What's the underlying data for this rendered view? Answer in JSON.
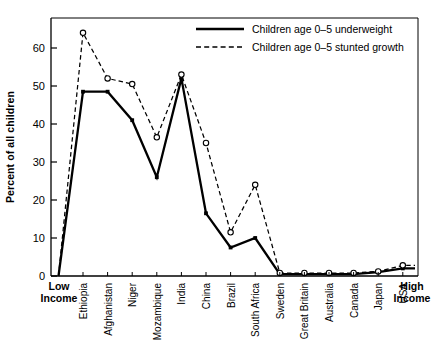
{
  "chart_data": {
    "type": "line",
    "title": "",
    "xlabel": "",
    "ylabel": "Percent of all children",
    "ylim": [
      0,
      68
    ],
    "yticks": [
      0,
      10,
      20,
      30,
      40,
      50,
      60
    ],
    "grid": false,
    "legend_position": "top-right",
    "axis_end_labels": {
      "left_line1": "Low",
      "left_line2": "Income",
      "right_line1": "High",
      "right_line2": "Income"
    },
    "categories": [
      "Ethiopia",
      "Afghanistan",
      "Niger",
      "Mozambique",
      "India",
      "China",
      "Brazil",
      "South Africa",
      "Sweden",
      "Great Britain",
      "Australia",
      "Canada",
      "Japan",
      "USA"
    ],
    "series": [
      {
        "name": "Children age 0–5 underweight",
        "style": "solid",
        "marker": "square-filled",
        "values": [
          48.5,
          48.5,
          41,
          26,
          52,
          16.5,
          7.5,
          10,
          0.5,
          0.5,
          0.5,
          0.5,
          1,
          2
        ]
      },
      {
        "name": "Children age 0–5 stunted growth",
        "style": "dashed",
        "marker": "circle-open",
        "values": [
          64,
          52,
          50.5,
          36.5,
          53,
          35,
          11.5,
          24,
          0.8,
          0.8,
          0.8,
          0.8,
          1.2,
          2.8
        ]
      }
    ],
    "origin_value": 0
  },
  "legend": {
    "items": [
      {
        "label": "Children age 0–5 underweight",
        "style": "solid"
      },
      {
        "label": "Children age 0–5 stunted growth",
        "style": "dashed"
      }
    ]
  },
  "colors": {
    "line": "#000000",
    "frame": "#000000",
    "background": "#ffffff"
  }
}
